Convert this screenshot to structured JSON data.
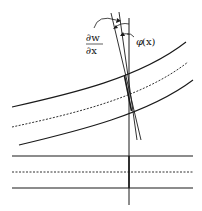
{
  "figure": {
    "type": "beam-deformation-diagram",
    "labels": {
      "slope_numerator": "∂w",
      "slope_denominator": "∂x",
      "rotation_symbol": "φ",
      "rotation_arg": "(x)"
    },
    "colors": {
      "stroke": "#1a1a1a",
      "background": "#ffffff"
    }
  }
}
